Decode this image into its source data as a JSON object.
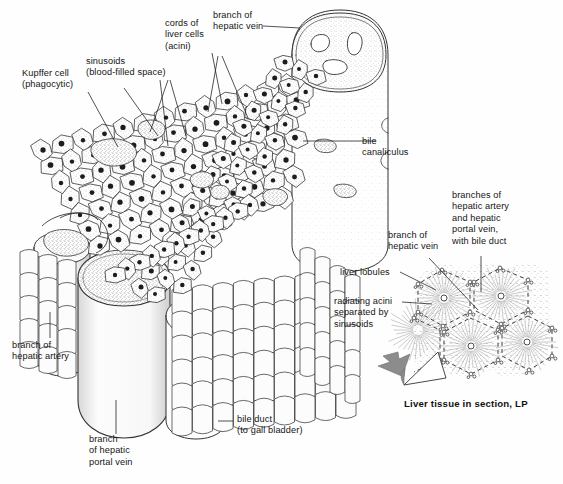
{
  "figure": {
    "background_color": "#fefefe",
    "ink_color": "#1a1a1a",
    "arrow_color": "#8c8c8c"
  },
  "labels": [
    {
      "id": "kupffer-cell",
      "text": "Kupffer cell\n(phagocytic)",
      "x": 22,
      "y": 68,
      "align": "left",
      "leader": [
        [
          88,
          92
        ],
        [
          118,
          147
        ]
      ]
    },
    {
      "id": "sinusoids",
      "text": "sinusoids\n(blood-filled space)",
      "x": 86,
      "y": 56,
      "align": "left",
      "leader": [
        [
          160,
          80
        ],
        [
          168,
          146
        ]
      ]
    },
    {
      "id": "cords-of-liver-cells",
      "text": "cords of\nliver cells\n(acini)",
      "x": 165,
      "y": 18,
      "align": "left",
      "leader": [
        [
          212,
          53
        ],
        [
          222,
          104
        ]
      ]
    },
    {
      "id": "branch-of-hepatic-vein-main",
      "text": "branch of\nhepatic vein",
      "x": 213,
      "y": 10,
      "align": "left",
      "leader": [
        [
          263,
          26
        ],
        [
          300,
          28
        ]
      ]
    },
    {
      "id": "bile-canaliculus",
      "text": "bile\ncanaliculus",
      "x": 378,
      "y": 136,
      "align": "left",
      "leader": [
        [
          376,
          141
        ],
        [
          303,
          141
        ]
      ]
    },
    {
      "id": "branch-of-hepatic-artery",
      "text": "branch of\nhepatic artery",
      "x": 12,
      "y": 340,
      "align": "left",
      "leader": [
        [
          50,
          338
        ],
        [
          50,
          312
        ]
      ]
    },
    {
      "id": "branch-of-hepatic-portal-vein",
      "text": "branch\nof hepatic\nportal vein",
      "x": 96,
      "y": 436,
      "align": "left",
      "leader": [
        [
          116,
          434
        ],
        [
          116,
          400
        ]
      ]
    },
    {
      "id": "bile-duct",
      "text": "bile duct\n(to gall bladder)",
      "x": 237,
      "y": 415,
      "align": "left",
      "leader": [
        [
          233,
          421
        ],
        [
          218,
          421
        ]
      ]
    },
    {
      "id": "branch-of-hepatic-vein-inset",
      "text": "branch of\nhepatic vein",
      "x": 390,
      "y": 234,
      "align": "left",
      "leader": [
        [
          429,
          258
        ],
        [
          478,
          310
        ]
      ]
    },
    {
      "id": "branches-hepatic-artery-portal-vein-bile-duct",
      "text": "branches of\nhepatic artery\nand hepatic\nportal vein,\nwith bile duct",
      "x": 452,
      "y": 190,
      "align": "left",
      "leader": [
        [
          481,
          256
        ],
        [
          481,
          292
        ]
      ]
    },
    {
      "id": "liver-lobules",
      "text": "liver lobules",
      "x": 340,
      "y": 267,
      "align": "left",
      "leader": [
        [
          400,
          272
        ],
        [
          436,
          290
        ]
      ]
    },
    {
      "id": "radiating-acini",
      "text": "radiating acini\nseparated by\nsinusoids",
      "x": 334,
      "y": 296,
      "align": "left",
      "leader": [
        [
          402,
          302
        ],
        [
          432,
          304
        ]
      ]
    }
  ],
  "inset": {
    "caption": "Liver tissue in section, LP",
    "caption_x": 404,
    "caption_y": 398
  },
  "icons": {
    "callout_leader": "leader-line",
    "magnify_arrow": "left-pointing-arrow",
    "lobule_boundary": "dashed-hexagon"
  }
}
